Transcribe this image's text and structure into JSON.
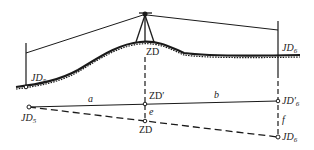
{
  "diagram": {
    "type": "surveying-turning-point-profile",
    "colors": {
      "line": "#1a1a1a",
      "background": "#ffffff"
    },
    "profile": {
      "left_station": {
        "label": "JD",
        "sub": "5"
      },
      "turning_point": {
        "label": "ZD"
      },
      "right_station": {
        "label": "JD",
        "sub": "6"
      }
    },
    "plan": {
      "left_point": {
        "label": "JD",
        "sub": "5"
      },
      "turning_point_prime": {
        "label": "ZD′"
      },
      "turning_point": {
        "label": "ZD"
      },
      "right_point_prime": {
        "label": "JD′",
        "sub": "6"
      },
      "right_point": {
        "label": "JD",
        "sub": "6"
      },
      "distances": {
        "a": "a",
        "b": "b",
        "e": "e",
        "f": "f"
      }
    }
  }
}
